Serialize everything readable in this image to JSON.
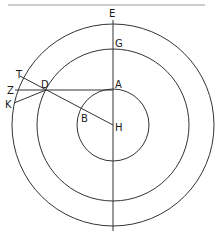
{
  "diagram": {
    "type": "concentric-circles-geometry",
    "center": {
      "x": 113,
      "y": 125
    },
    "circles": [
      {
        "name": "outer",
        "r": 101
      },
      {
        "name": "middle",
        "r": 76
      },
      {
        "name": "inner",
        "r": 36
      }
    ],
    "points": {
      "E": {
        "label": "E",
        "x": 113,
        "y": 20
      },
      "G": {
        "label": "G",
        "x": 113,
        "y": 49
      },
      "A": {
        "label": "A",
        "x": 113,
        "y": 89
      },
      "H": {
        "label": "H",
        "x": 113,
        "y": 125
      },
      "B": {
        "label": "B",
        "x": 83,
        "y": 109
      },
      "D": {
        "label": "D",
        "x": 46,
        "y": 90
      },
      "T": {
        "label": "T",
        "x": 20,
        "y": 76
      },
      "Z": {
        "label": "Z",
        "x": 15,
        "y": 90
      },
      "K": {
        "label": "K",
        "x": 14,
        "y": 103
      }
    },
    "segments": [
      [
        "E",
        "bottom"
      ],
      [
        "Z",
        "A"
      ],
      [
        "T",
        "H"
      ],
      [
        "K",
        "D"
      ]
    ]
  }
}
